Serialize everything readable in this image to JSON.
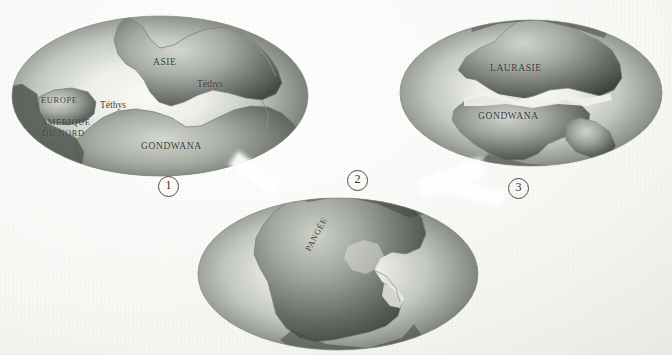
{
  "figure": {
    "kind": "continental-drift-map-series",
    "language": "fr",
    "background_color": "#fbfbf9",
    "ocean_light": "#f2f2ee",
    "ocean_dark": "#6f7570",
    "land_light": "#b9bdb6",
    "land_dark": "#4d524d",
    "ink_color": "#3a3a36"
  },
  "globes": [
    {
      "id": "globe-1",
      "marker": "1",
      "labels": [
        {
          "name": "label-asie",
          "text": "ASIE"
        },
        {
          "name": "label-tethys-north",
          "text": "Téthys"
        },
        {
          "name": "label-tethys-west",
          "text": "Téthys"
        },
        {
          "name": "label-europe",
          "text": "EUROPE"
        },
        {
          "name": "label-amerique-du-nord",
          "text": "AMERIQUE"
        },
        {
          "name": "label-amerique-du-nord-line2",
          "text": "DU NORD"
        },
        {
          "name": "label-gondwana",
          "text": "GONDWANA"
        }
      ]
    },
    {
      "id": "globe-2",
      "marker": "2",
      "labels": [
        {
          "name": "label-pangee",
          "text": "PANGÉE"
        }
      ]
    },
    {
      "id": "globe-3",
      "marker": "3",
      "labels": [
        {
          "name": "label-laurasie",
          "text": "LAURASIE"
        },
        {
          "name": "label-gondwana",
          "text": "GONDWANA"
        }
      ]
    }
  ],
  "markers": {
    "one": "1",
    "two": "2",
    "three": "3"
  },
  "texts": {
    "asie": "ASIE",
    "tethys_a": "Téthys",
    "tethys_b": "Téthys",
    "europe": "EUROPE",
    "amerique1": "AMERIQUE",
    "amerique2": "DU NORD",
    "gondwana1": "GONDWANA",
    "pangee": "PANGÉE",
    "laurasie": "LAURASIE",
    "gondwana3": "GONDWANA"
  }
}
